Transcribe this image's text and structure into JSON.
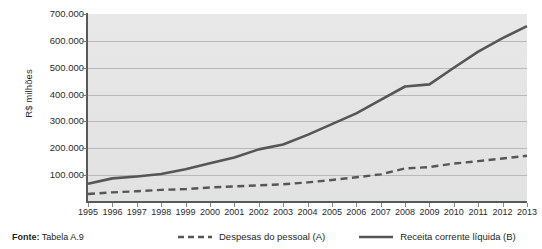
{
  "figure": {
    "y_axis_title": "R$ milhões",
    "source_label": "Fonte:",
    "source_value": " Tabela A.9"
  },
  "chart_data": {
    "type": "line",
    "title": "",
    "xlabel": "",
    "ylabel": "R$ milhões",
    "ylim": [
      0,
      700000
    ],
    "xlim": [
      1995,
      2013
    ],
    "grid": true,
    "legend_position": "bottom",
    "categories": [
      "1995",
      "1996",
      "1997",
      "1998",
      "1999",
      "2000",
      "2001",
      "2002",
      "2003",
      "2004",
      "2005",
      "2006",
      "2007",
      "2008",
      "2009",
      "2010",
      "2011",
      "2012",
      "2013"
    ],
    "ytick_labels": [
      "700.000",
      "600.000",
      "500.000",
      "400.000",
      "300.000",
      "200.000",
      "100.000"
    ],
    "ytick_values": [
      700000,
      600000,
      500000,
      400000,
      300000,
      200000,
      100000
    ],
    "series": [
      {
        "name": "Despesas do pessoal (A)",
        "style": "dashed",
        "color": "#565656",
        "values": [
          30000,
          36000,
          40000,
          45000,
          48000,
          54000,
          58000,
          62000,
          66000,
          73000,
          82000,
          92000,
          103000,
          125000,
          130000,
          143000,
          152000,
          162000,
          172000
        ]
      },
      {
        "name": "Receita corrente líquida (B)",
        "style": "solid",
        "color": "#565656",
        "values": [
          68000,
          88000,
          95000,
          104000,
          122000,
          144000,
          166000,
          196000,
          214000,
          250000,
          290000,
          330000,
          380000,
          430000,
          438000,
          500000,
          560000,
          610000,
          655000
        ]
      }
    ]
  }
}
